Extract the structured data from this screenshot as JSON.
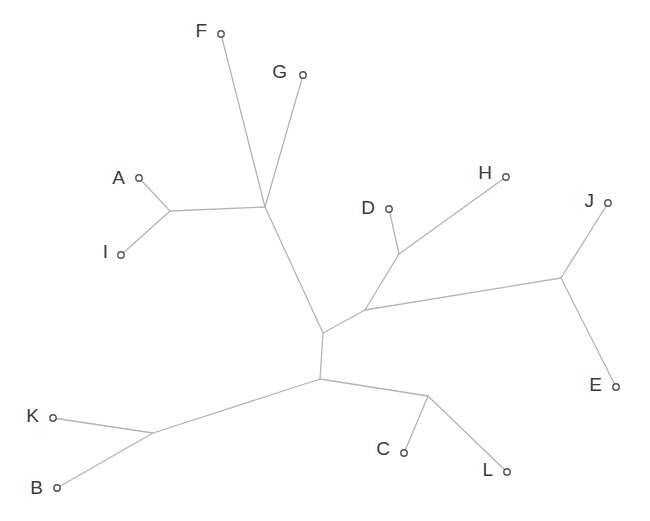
{
  "figure": {
    "width": 650,
    "height": 521,
    "background_color": "#ffffff",
    "branch_color": "#b4b4b4",
    "branch_width": 1.3,
    "label_color": "#3b3b3b",
    "label_font_size": 19,
    "marker": {
      "radius": 3.2,
      "fill_color": "#ffffff",
      "stroke_color": "#555555"
    }
  },
  "chart_data": {
    "type": "diagram",
    "subtype": "unrooted-phylogenetic-tree",
    "title": "",
    "xlabel": "",
    "ylabel": "",
    "grid": false,
    "legend": "none",
    "axis_visible": false,
    "leaf_count": 12,
    "internal_node_count": 9,
    "leaves": [
      {
        "label": "A",
        "x": 139,
        "y": 178,
        "label_x": 125,
        "label_y": 179,
        "label_anchor": "end"
      },
      {
        "label": "B",
        "x": 57,
        "y": 488,
        "label_x": 43,
        "label_y": 489,
        "label_anchor": "end"
      },
      {
        "label": "C",
        "x": 404,
        "y": 453,
        "label_x": 390,
        "label_y": 450,
        "label_anchor": "end"
      },
      {
        "label": "D",
        "x": 389,
        "y": 209,
        "label_x": 375,
        "label_y": 209,
        "label_anchor": "end"
      },
      {
        "label": "E",
        "x": 616,
        "y": 387,
        "label_x": 602,
        "label_y": 386,
        "label_anchor": "end"
      },
      {
        "label": "F",
        "x": 221,
        "y": 34,
        "label_x": 207,
        "label_y": 32,
        "label_anchor": "end"
      },
      {
        "label": "G",
        "x": 303,
        "y": 75,
        "label_x": 287,
        "label_y": 73,
        "label_anchor": "end"
      },
      {
        "label": "H",
        "x": 506,
        "y": 177,
        "label_x": 492,
        "label_y": 174,
        "label_anchor": "end"
      },
      {
        "label": "I",
        "x": 121,
        "y": 255,
        "label_x": 108,
        "label_y": 253,
        "label_anchor": "end"
      },
      {
        "label": "J",
        "x": 608,
        "y": 203,
        "label_x": 594,
        "label_y": 202,
        "label_anchor": "end"
      },
      {
        "label": "K",
        "x": 53,
        "y": 418,
        "label_x": 39,
        "label_y": 417,
        "label_anchor": "end"
      },
      {
        "label": "L",
        "x": 507,
        "y": 472,
        "label_x": 493,
        "label_y": 471,
        "label_anchor": "end"
      }
    ],
    "internal_nodes": [
      {
        "id": "n_AI",
        "x": 170,
        "y": 211
      },
      {
        "id": "n_FG",
        "x": 265,
        "y": 207
      },
      {
        "id": "n_upper",
        "x": 323,
        "y": 333
      },
      {
        "id": "n_DH",
        "x": 399,
        "y": 254
      },
      {
        "id": "n_right",
        "x": 365,
        "y": 310
      },
      {
        "id": "n_JE",
        "x": 561,
        "y": 278
      },
      {
        "id": "n_lower",
        "x": 320,
        "y": 379
      },
      {
        "id": "n_KB",
        "x": 153,
        "y": 433
      },
      {
        "id": "n_CL",
        "x": 428,
        "y": 396
      }
    ],
    "edges": [
      {
        "from": "A",
        "to": "n_AI",
        "x1": 139,
        "y1": 178,
        "x2": 170,
        "y2": 211
      },
      {
        "from": "I",
        "to": "n_AI",
        "x1": 121,
        "y1": 255,
        "x2": 170,
        "y2": 211
      },
      {
        "from": "n_AI",
        "to": "n_FG",
        "x1": 170,
        "y1": 211,
        "x2": 265,
        "y2": 207
      },
      {
        "from": "F",
        "to": "n_FG",
        "x1": 221,
        "y1": 34,
        "x2": 265,
        "y2": 207
      },
      {
        "from": "G",
        "to": "n_FG",
        "x1": 303,
        "y1": 75,
        "x2": 265,
        "y2": 207
      },
      {
        "from": "n_FG",
        "to": "n_upper",
        "x1": 265,
        "y1": 207,
        "x2": 323,
        "y2": 333
      },
      {
        "from": "D",
        "to": "n_DH",
        "x1": 389,
        "y1": 209,
        "x2": 399,
        "y2": 254
      },
      {
        "from": "H",
        "to": "n_DH",
        "x1": 506,
        "y1": 177,
        "x2": 399,
        "y2": 254
      },
      {
        "from": "n_DH",
        "to": "n_right",
        "x1": 399,
        "y1": 254,
        "x2": 365,
        "y2": 310
      },
      {
        "from": "n_right",
        "to": "n_JE",
        "x1": 365,
        "y1": 310,
        "x2": 561,
        "y2": 278
      },
      {
        "from": "J",
        "to": "n_JE",
        "x1": 608,
        "y1": 203,
        "x2": 561,
        "y2": 278
      },
      {
        "from": "E",
        "to": "n_JE",
        "x1": 616,
        "y1": 387,
        "x2": 561,
        "y2": 278
      },
      {
        "from": "n_right",
        "to": "n_upper",
        "x1": 365,
        "y1": 310,
        "x2": 323,
        "y2": 333
      },
      {
        "from": "n_upper",
        "to": "n_lower",
        "x1": 323,
        "y1": 333,
        "x2": 320,
        "y2": 379
      },
      {
        "from": "n_lower",
        "to": "n_KB",
        "x1": 320,
        "y1": 379,
        "x2": 153,
        "y2": 433
      },
      {
        "from": "K",
        "to": "n_KB",
        "x1": 53,
        "y1": 418,
        "x2": 153,
        "y2": 433
      },
      {
        "from": "B",
        "to": "n_KB",
        "x1": 57,
        "y1": 488,
        "x2": 153,
        "y2": 433
      },
      {
        "from": "n_lower",
        "to": "n_CL",
        "x1": 320,
        "y1": 379,
        "x2": 428,
        "y2": 396
      },
      {
        "from": "C",
        "to": "n_CL",
        "x1": 404,
        "y1": 453,
        "x2": 428,
        "y2": 396
      },
      {
        "from": "L",
        "to": "n_CL",
        "x1": 507,
        "y1": 472,
        "x2": 428,
        "y2": 396
      }
    ]
  }
}
